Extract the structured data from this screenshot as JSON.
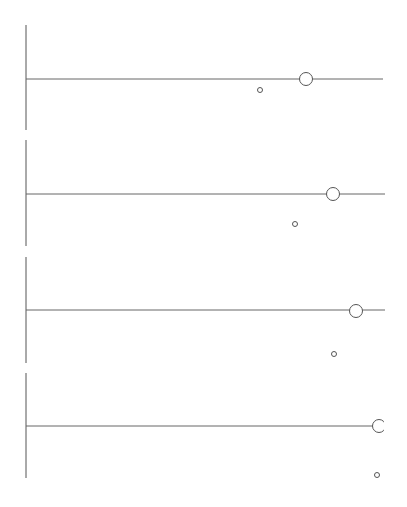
{
  "diagram": {
    "width": 407,
    "height": 507,
    "stroke_color": "#555555",
    "line_color": "#666666",
    "background": "#ffffff",
    "panels": [
      {
        "axis_x": 26,
        "axis_top": 25,
        "axis_bottom": 130,
        "line_y": 79,
        "line_start": 26,
        "line_end": 383,
        "large_circle": {
          "cx": 306,
          "cy": 79,
          "r": 6.5
        },
        "small_circle": {
          "cx": 260,
          "cy": 90,
          "r": 2.5
        }
      },
      {
        "axis_x": 26,
        "axis_top": 140,
        "axis_bottom": 246,
        "line_y": 194,
        "line_start": 26,
        "line_end": 385,
        "large_circle": {
          "cx": 333,
          "cy": 194,
          "r": 6.5
        },
        "small_circle": {
          "cx": 295,
          "cy": 224,
          "r": 2.5
        }
      },
      {
        "axis_x": 26,
        "axis_top": 257,
        "axis_bottom": 363,
        "line_y": 310,
        "line_start": 26,
        "line_end": 385,
        "large_circle": {
          "cx": 356,
          "cy": 311,
          "r": 6.5
        },
        "small_circle": {
          "cx": 334,
          "cy": 354,
          "r": 2.5
        }
      },
      {
        "axis_x": 26,
        "axis_top": 373,
        "axis_bottom": 478,
        "line_y": 426,
        "line_start": 26,
        "line_end": 378,
        "large_circle": {
          "cx": 379,
          "cy": 426,
          "r": 6.5,
          "clip_right": 384
        },
        "small_circle": {
          "cx": 377,
          "cy": 475,
          "r": 2.5
        }
      }
    ]
  }
}
